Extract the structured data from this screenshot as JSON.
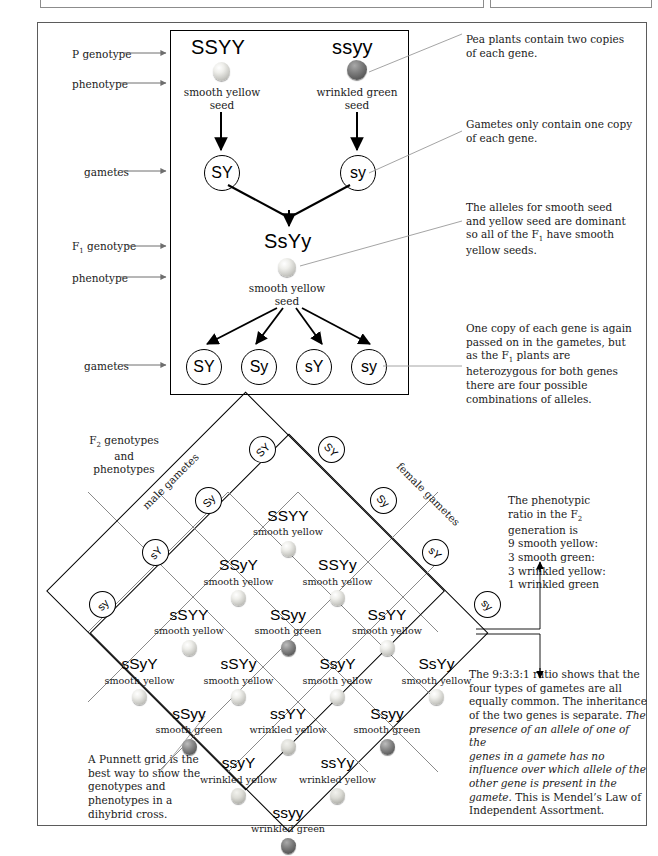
{
  "diagram": {
    "cross_box": {
      "p_generation": {
        "row_labels": [
          "P genotype",
          "phenotype",
          "gametes"
        ],
        "parents": [
          {
            "genotype": "SSYY",
            "phenotype_line1": "smooth yellow",
            "phenotype_line2": "seed",
            "seed_type": "smooth-yellow",
            "gamete": "SY"
          },
          {
            "genotype": "ssyy",
            "phenotype_line1": "wrinkled green",
            "phenotype_line2": "seed",
            "seed_type": "wrinkled-green",
            "gamete": "sy"
          }
        ]
      },
      "f1_generation": {
        "row_labels": [
          "F₁ genotype",
          "phenotype",
          "gametes"
        ],
        "genotype": "SsYy",
        "phenotype_line1": "smooth yellow",
        "phenotype_line2": "seed",
        "seed_type": "smooth-yellow",
        "gametes": [
          "SY",
          "Sy",
          "sY",
          "sy"
        ]
      }
    },
    "annotations": [
      {
        "id": "note-two-copies",
        "text": "Pea plants contain two copies of each gene."
      },
      {
        "id": "note-gametes-one-copy",
        "text": "Gametes only contain one copy of each gene."
      },
      {
        "id": "note-dominance",
        "text": "The alleles for smooth seed and yellow seed are dominant so all of the F₁ have smooth yellow seeds."
      },
      {
        "id": "note-four-combinations",
        "text": "One copy of each gene is again passed on in the gametes, but as the F₁ plants are heterozygous for both genes there are four possible combinations of alleles."
      },
      {
        "id": "note-phenotypic-ratio",
        "text": "The phenotypic ratio in the F₂ generation is 9 smooth yellow: 3 smooth green: 3 wrinkled yellow: 1 wrinkled green"
      },
      {
        "id": "note-punnett-grid",
        "text": "A Punnett grid is the best way to show the genotypes and phenotypes in a dihybrid cross."
      }
    ],
    "note_ratio_lines": [
      "The phenotypic",
      "ratio in the F₂",
      "generation is",
      "9 smooth yellow:",
      "3 smooth green:",
      "3 wrinkled yellow:",
      "1 wrinkled green"
    ],
    "note_law_lines": [
      {
        "text": "The 9:3:3:1 ratio shows that the",
        "italic": false
      },
      {
        "text": "four types of gametes are all",
        "italic": false
      },
      {
        "text": "equally common. The inheritance",
        "italic": false
      },
      {
        "text": "of the two genes is separate. ",
        "italic": false,
        "tail": "The",
        "tail_italic": true
      },
      {
        "text": "presence of an allele of one of the",
        "italic": true
      },
      {
        "text": "genes in a gamete has no",
        "italic": true
      },
      {
        "text": "influence over which allele of the",
        "italic": true
      },
      {
        "text": "other gene is present in the",
        "italic": true
      },
      {
        "text": "gamete.",
        "italic": true,
        "tail": " This is Mendel’s Law of",
        "tail_italic": false
      },
      {
        "text": "Independent Assortment.",
        "italic": false
      }
    ],
    "punnett": {
      "corner_label_lines": [
        "F₂ genotypes",
        "and",
        "phenotypes"
      ],
      "male_gametes_label": "male gametes",
      "female_gametes_label": "female gametes",
      "male_gametes": [
        "SY",
        "Sy",
        "sY",
        "sy"
      ],
      "female_gametes": [
        "SY",
        "Sy",
        "sY",
        "sy"
      ],
      "cells": [
        [
          {
            "genotype": "SSYY",
            "phenotype": "smooth yellow",
            "seed_type": "smooth-yellow"
          },
          {
            "genotype": "SSYy",
            "phenotype": "smooth yellow",
            "seed_type": "smooth-yellow"
          },
          {
            "genotype": "SsYY",
            "phenotype": "smooth yellow",
            "seed_type": "smooth-yellow"
          },
          {
            "genotype": "SsYy",
            "phenotype": "smooth yellow",
            "seed_type": "smooth-yellow"
          }
        ],
        [
          {
            "genotype": "SSyY",
            "phenotype": "smooth yellow",
            "seed_type": "smooth-yellow"
          },
          {
            "genotype": "SSyy",
            "phenotype": "smooth green",
            "seed_type": "smooth-green"
          },
          {
            "genotype": "SsyY",
            "phenotype": "smooth yellow",
            "seed_type": "smooth-yellow"
          },
          {
            "genotype": "Ssyy",
            "phenotype": "smooth green",
            "seed_type": "smooth-green"
          }
        ],
        [
          {
            "genotype": "sSYY",
            "phenotype": "smooth yellow",
            "seed_type": "smooth-yellow"
          },
          {
            "genotype": "sSYy",
            "phenotype": "smooth yellow",
            "seed_type": "smooth-yellow"
          },
          {
            "genotype": "ssYY",
            "phenotype": "wrinkled yellow",
            "seed_type": "wrinkled-yellow"
          },
          {
            "genotype": "ssYy",
            "phenotype": "wrinkled yellow",
            "seed_type": "wrinkled-yellow"
          }
        ],
        [
          {
            "genotype": "sSyY",
            "phenotype": "smooth yellow",
            "seed_type": "smooth-yellow"
          },
          {
            "genotype": "sSyy",
            "phenotype": "smooth green",
            "seed_type": "smooth-green"
          },
          {
            "genotype": "ssyY",
            "phenotype": "wrinkled yellow",
            "seed_type": "wrinkled-yellow"
          },
          {
            "genotype": "ssyy",
            "phenotype": "wrinkled green",
            "seed_type": "wrinkled-green"
          }
        ]
      ]
    },
    "colors": {
      "ink": "#1a1a1a",
      "frame": "#5b5b5b",
      "box_border": "#000000",
      "grid_line": "#777777",
      "leader_line": "#8a8a8a"
    }
  }
}
